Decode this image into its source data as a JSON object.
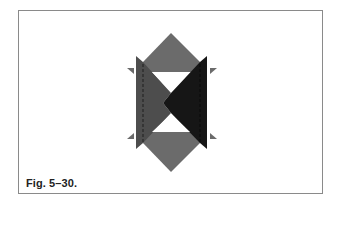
{
  "figure": {
    "caption": "Fig. 5–30."
  },
  "colors": {
    "frame_border": "#8a8a8a",
    "diamond_fill": "#6b6b6b",
    "left_flap_fill": "#4d4d4d",
    "right_flap_fill": "#161616",
    "window_fill": "#ffffff",
    "tab_fill": "#6b6b6b",
    "fold_line": "#1e1e1e"
  }
}
